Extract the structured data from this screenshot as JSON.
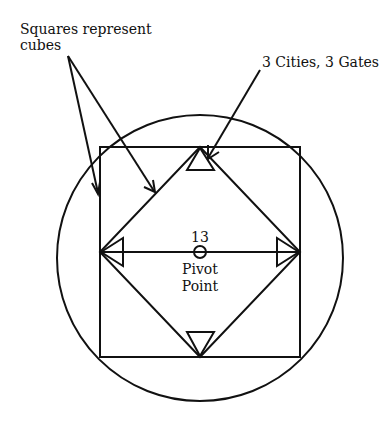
{
  "diagram": {
    "labels": {
      "squares_line1": "Squares represent",
      "squares_line2": "cubes",
      "gates": "3 Cities, 3 Gates",
      "number": "13",
      "pivot_line1": "Pivot",
      "pivot_line2": "Point"
    },
    "shapes": [
      "outer-circle",
      "outer-square",
      "inner-diamond",
      "horizontal-axis",
      "pivot-circle",
      "top-triangle",
      "left-triangle",
      "right-triangle",
      "bottom-triangle"
    ],
    "colors": {
      "stroke": "#111111",
      "background": "#ffffff"
    }
  }
}
